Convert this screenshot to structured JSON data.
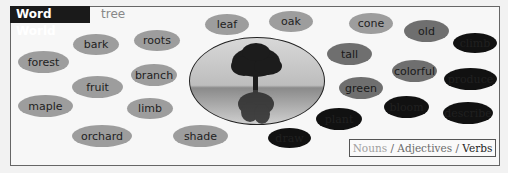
{
  "header": {
    "app_title": "Word World",
    "topic": "tree"
  },
  "colors": {
    "noun": "#9d9d9d",
    "adjective": "#6f6f6f",
    "verb": "#111111",
    "title_bg": "#1a1a1a"
  },
  "center_image": {
    "icon": "tree-reflection-image"
  },
  "words": [
    {
      "text": "bark",
      "type": "noun"
    },
    {
      "text": "roots",
      "type": "noun"
    },
    {
      "text": "leaf",
      "type": "noun"
    },
    {
      "text": "oak",
      "type": "noun"
    },
    {
      "text": "cone",
      "type": "noun"
    },
    {
      "text": "forest",
      "type": "noun"
    },
    {
      "text": "branch",
      "type": "noun"
    },
    {
      "text": "fruit",
      "type": "noun"
    },
    {
      "text": "maple",
      "type": "noun"
    },
    {
      "text": "limb",
      "type": "noun"
    },
    {
      "text": "orchard",
      "type": "noun"
    },
    {
      "text": "shade",
      "type": "noun"
    },
    {
      "text": "old",
      "type": "adjective"
    },
    {
      "text": "tall",
      "type": "adjective"
    },
    {
      "text": "colorful",
      "type": "adjective"
    },
    {
      "text": "green",
      "type": "adjective"
    },
    {
      "text": "climb",
      "type": "verb"
    },
    {
      "text": "produce",
      "type": "verb"
    },
    {
      "text": "describe",
      "type": "verb"
    },
    {
      "text": "bloom",
      "type": "verb"
    },
    {
      "text": "plant",
      "type": "verb"
    },
    {
      "text": "draw",
      "type": "verb"
    }
  ],
  "legend": {
    "nouns": "Nouns",
    "adjectives": "Adjectives",
    "verbs": "Verbs",
    "separator": "/"
  }
}
